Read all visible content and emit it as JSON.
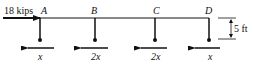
{
  "diagram": {
    "applied_load": {
      "label": "18 kips",
      "direction": "right"
    },
    "nodes": [
      {
        "name": "A",
        "x": 40,
        "reaction_label": "x"
      },
      {
        "name": "B",
        "x": 95,
        "reaction_label": "2x"
      },
      {
        "name": "C",
        "x": 155,
        "reaction_label": "2x"
      },
      {
        "name": "D",
        "x": 209,
        "reaction_label": "x"
      }
    ],
    "dimension": {
      "label": "5 ft"
    },
    "colors": {
      "ink": "#111111",
      "background": "#ffffff"
    }
  }
}
